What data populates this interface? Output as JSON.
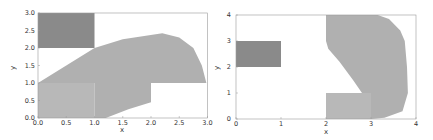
{
  "colors": {
    "dark_region": "#8a8a8a",
    "light_region": "#b8b8b8",
    "hatch": "#a0a0a0",
    "frame": "#999999",
    "text": "#333333"
  },
  "chart_data": [
    {
      "type": "area",
      "title": "",
      "xlabel": "x",
      "ylabel": "y",
      "xlim": [
        0.0,
        3.0
      ],
      "ylim": [
        0.0,
        3.0
      ],
      "xticks": [
        "0.0",
        "0.5",
        "1.0",
        "1.5",
        "2.0",
        "2.5",
        "3.0"
      ],
      "yticks": [
        "0.0",
        "0.5",
        "1.0",
        "1.5",
        "2.0",
        "2.5",
        "3.0"
      ],
      "grid": false,
      "legend": null,
      "regions": [
        {
          "name": "obstacle",
          "shade": "dark",
          "polygon": [
            [
              0,
              2
            ],
            [
              1,
              2
            ],
            [
              1,
              3
            ],
            [
              0,
              3
            ]
          ]
        },
        {
          "name": "start-set",
          "shade": "light",
          "polygon": [
            [
              0,
              0
            ],
            [
              1,
              0
            ],
            [
              1,
              1
            ],
            [
              0,
              1
            ]
          ]
        },
        {
          "name": "reachable-set",
          "shade": "light-hatched",
          "polygon": [
            [
              0,
              1
            ],
            [
              1,
              2
            ],
            [
              1.5,
              2.25
            ],
            [
              2.2,
              2.42
            ],
            [
              2.5,
              2.3
            ],
            [
              2.75,
              2.0
            ],
            [
              2.9,
              1.5
            ],
            [
              2.98,
              1.0
            ],
            [
              2,
              1
            ],
            [
              2,
              0.45
            ],
            [
              1.6,
              0.25
            ],
            [
              1.2,
              0
            ],
            [
              1,
              0
            ],
            [
              1,
              1
            ]
          ]
        }
      ]
    },
    {
      "type": "area",
      "title": "",
      "xlabel": "x",
      "ylabel": "y",
      "xlim": [
        0,
        4
      ],
      "ylim": [
        0,
        4
      ],
      "xticks": [
        "0",
        "1",
        "2",
        "3",
        "4"
      ],
      "yticks": [
        "0",
        "1",
        "2",
        "3",
        "4"
      ],
      "grid": false,
      "legend": null,
      "regions": [
        {
          "name": "obstacle",
          "shade": "dark",
          "polygon": [
            [
              0,
              2
            ],
            [
              1,
              2
            ],
            [
              1,
              3
            ],
            [
              0,
              3
            ]
          ]
        },
        {
          "name": "start-set",
          "shade": "light",
          "polygon": [
            [
              2,
              0
            ],
            [
              3,
              0
            ],
            [
              3,
              1
            ],
            [
              2,
              1
            ]
          ]
        },
        {
          "name": "reachable-set",
          "shade": "light-hatched",
          "polygon": [
            [
              2,
              4
            ],
            [
              3.15,
              4
            ],
            [
              3.4,
              3.85
            ],
            [
              3.65,
              3.4
            ],
            [
              3.75,
              3.0
            ],
            [
              3.8,
              2.0
            ],
            [
              3.82,
              1.0
            ],
            [
              3.7,
              0.3
            ],
            [
              3.3,
              0.05
            ],
            [
              3,
              0
            ],
            [
              3,
              1
            ],
            [
              2.8,
              1.0
            ],
            [
              2.6,
              1.5
            ],
            [
              2.3,
              2.2
            ],
            [
              2.05,
              2.7
            ],
            [
              2,
              3
            ]
          ]
        }
      ]
    }
  ]
}
